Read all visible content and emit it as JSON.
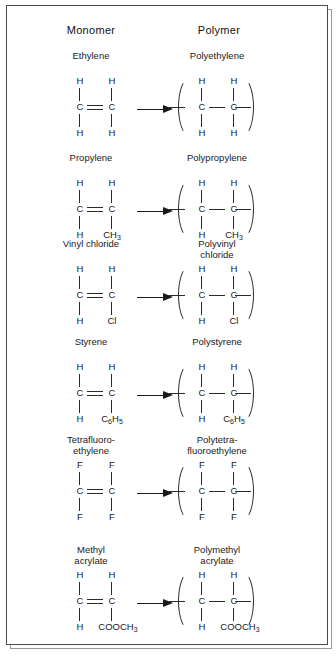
{
  "figure": {
    "headers": {
      "monomer": "Monomer",
      "polymer": "Polymer"
    },
    "arrow_icon": "right-arrow-icon"
  },
  "chart_data": {
    "type": "table",
    "columns": [
      "Monomer",
      "Polymer"
    ],
    "rows": [
      {
        "monomer_name": "Ethylene",
        "polymer_name": "Polyethylene",
        "monomer": {
          "top_left": "H",
          "top_right": "H",
          "carbon_left": "C",
          "carbon_right": "C",
          "bottom_left": "H",
          "bottom_right": "H",
          "cc_bond": "double"
        },
        "polymer": {
          "top_left": "H",
          "top_right": "H",
          "carbon_left": "C",
          "carbon_right": "C",
          "bottom_left": "H",
          "bottom_right": "H",
          "cc_bond": "single",
          "repeat_unit_brackets": true
        }
      },
      {
        "monomer_name": "Propylene",
        "polymer_name": "Polypropylene",
        "monomer": {
          "top_left": "H",
          "top_right": "H",
          "carbon_left": "C",
          "carbon_right": "C",
          "bottom_left": "H",
          "bottom_right": "CH3",
          "cc_bond": "double"
        },
        "polymer": {
          "top_left": "H",
          "top_right": "H",
          "carbon_left": "C",
          "carbon_right": "C",
          "bottom_left": "H",
          "bottom_right": "CH3",
          "cc_bond": "single",
          "repeat_unit_brackets": true
        }
      },
      {
        "monomer_name": "Vinyl chloride",
        "polymer_name": "Polyvinyl\nchloride",
        "monomer": {
          "top_left": "H",
          "top_right": "H",
          "carbon_left": "C",
          "carbon_right": "C",
          "bottom_left": "H",
          "bottom_right": "Cl",
          "cc_bond": "double"
        },
        "polymer": {
          "top_left": "H",
          "top_right": "H",
          "carbon_left": "C",
          "carbon_right": "C",
          "bottom_left": "H",
          "bottom_right": "Cl",
          "cc_bond": "single",
          "repeat_unit_brackets": true
        }
      },
      {
        "monomer_name": "Styrene",
        "polymer_name": "Polystyrene",
        "monomer": {
          "top_left": "H",
          "top_right": "H",
          "carbon_left": "C",
          "carbon_right": "C",
          "bottom_left": "H",
          "bottom_right": "C6H5",
          "cc_bond": "double"
        },
        "polymer": {
          "top_left": "H",
          "top_right": "H",
          "carbon_left": "C",
          "carbon_right": "C",
          "bottom_left": "H",
          "bottom_right": "C6H5",
          "cc_bond": "single",
          "repeat_unit_brackets": true
        }
      },
      {
        "monomer_name": "Tetrafluoro-\nethylene",
        "polymer_name": "Polytetra-\nfluoroethylene",
        "monomer": {
          "top_left": "F",
          "top_right": "F",
          "carbon_left": "C",
          "carbon_right": "C",
          "bottom_left": "F",
          "bottom_right": "F",
          "cc_bond": "double"
        },
        "polymer": {
          "top_left": "F",
          "top_right": "F",
          "carbon_left": "C",
          "carbon_right": "C",
          "bottom_left": "F",
          "bottom_right": "F",
          "cc_bond": "single",
          "repeat_unit_brackets": true
        }
      },
      {
        "monomer_name": "Methyl\nacrylate",
        "polymer_name": "Polymethyl\nacrylate",
        "monomer": {
          "top_left": "H",
          "top_right": "H",
          "carbon_left": "C",
          "carbon_right": "C",
          "bottom_left": "H",
          "bottom_right": "COOCH3",
          "cc_bond": "double"
        },
        "polymer": {
          "top_left": "H",
          "top_right": "H",
          "carbon_left": "C",
          "carbon_right": "C",
          "bottom_left": "H",
          "bottom_right": "COOCH3",
          "cc_bond": "single",
          "repeat_unit_brackets": true
        }
      }
    ]
  },
  "layout": {
    "row_tops": [
      44,
      146,
      232,
      330,
      428,
      538
    ],
    "colors": {
      "ink": "#1a1a1a",
      "frame": "#4a4a4a",
      "frame_shadow": "#9a9a9a"
    }
  }
}
